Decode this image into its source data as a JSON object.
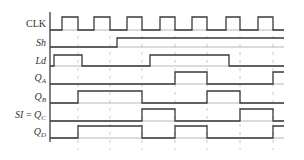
{
  "diagram": {
    "type": "timing-diagram",
    "signals": [
      {
        "id": "clk",
        "label": "CLK",
        "italic": false,
        "sub": "",
        "high_y": 17,
        "low_y": 30,
        "edges": [
          62,
          78,
          94,
          110,
          127,
          142,
          160,
          175,
          192,
          207,
          226,
          240,
          258,
          273
        ],
        "initial": 0
      },
      {
        "id": "sh",
        "label": "Sh",
        "italic": true,
        "sub": "",
        "high_y": 38,
        "low_y": 47,
        "edges": [
          117
        ],
        "initial": 0
      },
      {
        "id": "ld",
        "label": "Ld",
        "italic": true,
        "sub": "",
        "high_y": 55,
        "low_y": 66,
        "edges": [
          54,
          82,
          150,
          229
        ],
        "initial": 0
      },
      {
        "id": "qa",
        "label": "Q",
        "italic": true,
        "sub": "A",
        "high_y": 72,
        "low_y": 84,
        "edges": [
          175,
          207,
          273
        ],
        "initial": 0
      },
      {
        "id": "qb",
        "label": "Q",
        "italic": true,
        "sub": "B",
        "high_y": 91,
        "low_y": 103,
        "edges": [
          78,
          142,
          207,
          240
        ],
        "initial": 0
      },
      {
        "id": "qc",
        "label": "Q",
        "italic": true,
        "sub": "C",
        "prefix": "SI = ",
        "high_y": 109,
        "low_y": 121,
        "edges": [
          142,
          175,
          240,
          273
        ],
        "initial": 0
      },
      {
        "id": "qd",
        "label": "Q",
        "italic": true,
        "sub": "D",
        "high_y": 126,
        "low_y": 138,
        "edges": [
          78,
          142,
          175,
          207,
          273
        ],
        "initial": 0
      }
    ],
    "x_start": 50,
    "x_end": 284,
    "gridlines_x": [
      78,
      110,
      142,
      175,
      207,
      240,
      273
    ],
    "grid_y_range": [
      28,
      150
    ],
    "axis": {
      "x": 50,
      "y_top": 12,
      "y_bottom": 142
    },
    "colors": {
      "line": "#3a3a3a",
      "grid": "#bdbdbd",
      "text": "#333333"
    }
  }
}
